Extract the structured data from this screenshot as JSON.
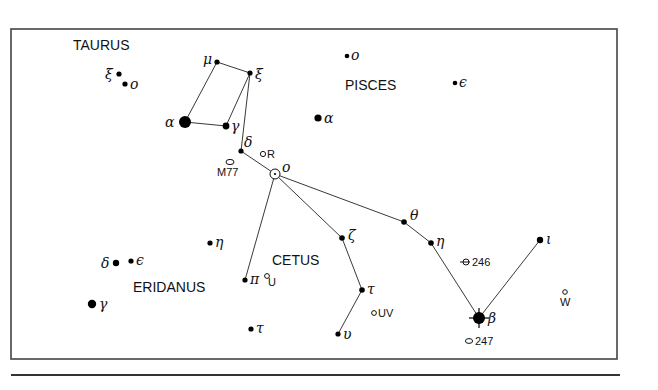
{
  "colors": {
    "ink": "#000000",
    "frame": "#444444",
    "background": "#ffffff"
  },
  "frame": {
    "x": 11,
    "y": 29,
    "width": 606,
    "height": 330,
    "rule_y": 375
  },
  "constellation_labels": [
    {
      "text": "TAURUS",
      "x": 73,
      "y": 50
    },
    {
      "text": "PISCES",
      "x": 345,
      "y": 90
    },
    {
      "text": "CETUS",
      "x": 272,
      "y": 265
    },
    {
      "text": "ERIDANUS",
      "x": 133,
      "y": 292
    }
  ],
  "stars": [
    {
      "id": "tau-xi",
      "name": "ξ",
      "constellation": "Taurus",
      "x": 119,
      "y": 74,
      "r": 2.6,
      "label_dx": -14,
      "label_dy": 5
    },
    {
      "id": "tau-omicron",
      "name": "ο",
      "constellation": "Taurus",
      "x": 125,
      "y": 84,
      "r": 2.6,
      "label_dx": 5,
      "label_dy": 5
    },
    {
      "id": "cet-mu",
      "name": "μ",
      "constellation": "Cetus",
      "x": 217,
      "y": 62,
      "r": 2.6,
      "label_dx": -14,
      "label_dy": 2
    },
    {
      "id": "cet-xi",
      "name": "ξ",
      "constellation": "Cetus",
      "x": 250,
      "y": 73,
      "r": 2.6,
      "label_dx": 5,
      "label_dy": 6
    },
    {
      "id": "cet-alpha",
      "name": "α",
      "constellation": "Cetus",
      "x": 185,
      "y": 122,
      "r": 6,
      "label_dx": -20,
      "label_dy": 5
    },
    {
      "id": "cet-gamma",
      "name": "γ",
      "constellation": "Cetus",
      "x": 226,
      "y": 126,
      "r": 3.4,
      "label_dx": 5,
      "label_dy": 5
    },
    {
      "id": "cet-delta",
      "name": "δ",
      "constellation": "Cetus",
      "x": 241,
      "y": 151,
      "r": 2.6,
      "label_dx": 3,
      "label_dy": -4
    },
    {
      "id": "psc-omicron",
      "name": "ο",
      "constellation": "Pisces",
      "x": 347,
      "y": 56,
      "r": 2.3,
      "label_dx": 4,
      "label_dy": 4
    },
    {
      "id": "psc-epsilon",
      "name": "ϵ",
      "constellation": "Pisces",
      "x": 455,
      "y": 83,
      "r": 2.3,
      "label_dx": 4,
      "label_dy": 4
    },
    {
      "id": "psc-alpha",
      "name": "α",
      "constellation": "Pisces",
      "x": 318,
      "y": 118,
      "r": 3.6,
      "label_dx": 6,
      "label_dy": 5
    },
    {
      "id": "cet-theta",
      "name": "θ",
      "constellation": "Cetus",
      "x": 404,
      "y": 222,
      "r": 2.8,
      "label_dx": 6,
      "label_dy": -2
    },
    {
      "id": "cet-zeta",
      "name": "ζ",
      "constellation": "Cetus",
      "x": 342,
      "y": 238,
      "r": 2.8,
      "label_dx": 6,
      "label_dy": 2
    },
    {
      "id": "cet-eta",
      "name": "η",
      "constellation": "Cetus",
      "x": 431,
      "y": 243,
      "r": 2.8,
      "label_dx": 5,
      "label_dy": 3
    },
    {
      "id": "cet-iota",
      "name": "ι",
      "constellation": "Cetus",
      "x": 540,
      "y": 240,
      "r": 3.2,
      "label_dx": 6,
      "label_dy": 4
    },
    {
      "id": "cet-tau",
      "name": "τ",
      "constellation": "Cetus",
      "x": 362,
      "y": 290,
      "r": 2.8,
      "label_dx": 5,
      "label_dy": 4
    },
    {
      "id": "cet-upsilon",
      "name": "υ",
      "constellation": "Cetus",
      "x": 338,
      "y": 334,
      "r": 2.6,
      "label_dx": 5,
      "label_dy": 5
    },
    {
      "id": "cet-beta",
      "name": "β",
      "constellation": "Cetus",
      "x": 479,
      "y": 318,
      "r": 6,
      "label_dx": 9,
      "label_dy": 5,
      "spikes": true
    },
    {
      "id": "cet-pi",
      "name": "π",
      "constellation": "Cetus",
      "x": 245,
      "y": 280,
      "r": 2.6,
      "label_dx": 5,
      "label_dy": 4
    },
    {
      "id": "cet-tau2",
      "name": "τ",
      "constellation": "Cetus",
      "x": 251,
      "y": 329,
      "r": 2.6,
      "label_dx": 5,
      "label_dy": 4
    },
    {
      "id": "eri-eta",
      "name": "η",
      "constellation": "Eridanus",
      "x": 210,
      "y": 243,
      "r": 2.6,
      "label_dx": 5,
      "label_dy": 4
    },
    {
      "id": "eri-delta",
      "name": "δ",
      "constellation": "Eridanus",
      "x": 116,
      "y": 263,
      "r": 3.2,
      "label_dx": -15,
      "label_dy": 5
    },
    {
      "id": "eri-epsilon",
      "name": "ϵ",
      "constellation": "Eridanus",
      "x": 131,
      "y": 261,
      "r": 2.6,
      "label_dx": 5,
      "label_dy": 4
    },
    {
      "id": "eri-gamma",
      "name": "γ",
      "constellation": "Eridanus",
      "x": 92,
      "y": 304,
      "r": 4.2,
      "label_dx": 7,
      "label_dy": 5
    }
  ],
  "special_objects": [
    {
      "id": "cet-omicron",
      "label": "ο",
      "type": "variable-mira",
      "x": 275,
      "y": 174,
      "r": 5,
      "label_dx": 7,
      "label_dy": -2,
      "italic": true
    },
    {
      "id": "R",
      "label": "R",
      "type": "variable",
      "x": 263,
      "y": 154,
      "r": 2.6,
      "label_dx": 4,
      "label_dy": 4
    },
    {
      "id": "M77",
      "label": "M77",
      "type": "galaxy",
      "x": 230,
      "y": 162,
      "rx": 4,
      "ry": 2.6,
      "label_dx": -13,
      "label_dy": 14
    },
    {
      "id": "U",
      "label": "U",
      "type": "variable",
      "x": 267,
      "y": 276,
      "r": 2.4,
      "label_dx": 1,
      "label_dy": 10
    },
    {
      "id": "UV",
      "label": "UV",
      "type": "variable",
      "x": 374,
      "y": 313,
      "r": 2.4,
      "label_dx": 4,
      "label_dy": 4
    },
    {
      "id": "NGC246",
      "label": "246",
      "type": "planetary-nebula",
      "x": 466,
      "y": 262,
      "r": 3,
      "label_dx": 6,
      "label_dy": 4
    },
    {
      "id": "NGC247",
      "label": "247",
      "type": "galaxy",
      "x": 469,
      "y": 341,
      "rx": 3.6,
      "ry": 2.4,
      "label_dx": 6,
      "label_dy": 4
    },
    {
      "id": "W",
      "label": "W",
      "type": "variable",
      "x": 565,
      "y": 292,
      "r": 2.3,
      "label_dx": -5,
      "label_dy": 14
    }
  ],
  "lines": [
    [
      "cet-mu",
      "cet-xi"
    ],
    [
      "cet-mu",
      "cet-alpha"
    ],
    [
      "cet-alpha",
      "cet-gamma"
    ],
    [
      "cet-gamma",
      "cet-xi"
    ],
    [
      "cet-xi",
      "cet-delta"
    ],
    [
      "cet-delta",
      "cet-omicron"
    ],
    [
      "cet-omicron",
      "cet-pi"
    ],
    [
      "cet-omicron",
      "cet-zeta"
    ],
    [
      "cet-omicron",
      "cet-theta"
    ],
    [
      "cet-theta",
      "cet-eta"
    ],
    [
      "cet-eta",
      "cet-beta"
    ],
    [
      "cet-beta",
      "cet-iota"
    ],
    [
      "cet-zeta",
      "cet-tau"
    ],
    [
      "cet-tau",
      "cet-upsilon"
    ]
  ]
}
